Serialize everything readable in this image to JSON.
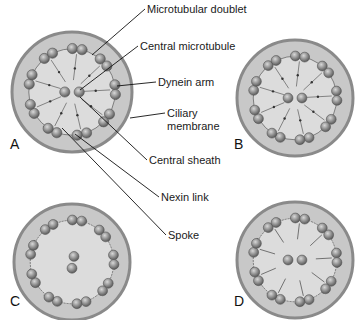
{
  "figure": {
    "labels": [
      {
        "id": "microtubular-doublet",
        "text": "Microtubular doublet",
        "x": 147,
        "y": 9
      },
      {
        "id": "central-microtubule",
        "text": "Central microtubule",
        "x": 140,
        "y": 46
      },
      {
        "id": "dynein-arm",
        "text": "Dynein arm",
        "x": 158,
        "y": 82
      },
      {
        "id": "ciliary-membrane-1",
        "text": "Ciliary",
        "x": 167,
        "y": 113
      },
      {
        "id": "ciliary-membrane-2",
        "text": "membrane",
        "x": 167,
        "y": 126
      },
      {
        "id": "central-sheath",
        "text": "Central sheath",
        "x": 149,
        "y": 160
      },
      {
        "id": "nexin-link",
        "text": "Nexin link",
        "x": 161,
        "y": 197
      },
      {
        "id": "spoke",
        "text": "Spoke",
        "x": 168,
        "y": 235
      }
    ],
    "panels": [
      {
        "id": "A",
        "text": "A",
        "x": 10,
        "y": 148
      },
      {
        "id": "B",
        "text": "B",
        "x": 234,
        "y": 148
      },
      {
        "id": "C",
        "text": "C",
        "x": 10,
        "y": 305
      },
      {
        "id": "D",
        "text": "D",
        "x": 234,
        "y": 305
      }
    ],
    "colors": {
      "membrane": "#8a8a8a",
      "cytoplasm": "#c8c8c8",
      "inner": "#dcdcdc",
      "tubule": "#7a7a7a",
      "line": "#111111"
    }
  }
}
